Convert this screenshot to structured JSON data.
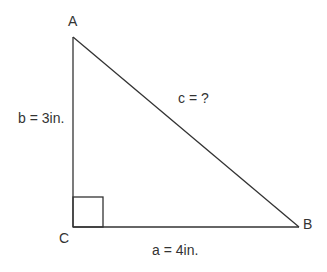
{
  "diagram": {
    "type": "right-triangle",
    "vertices": [
      {
        "id": "A",
        "label": "A",
        "x": 73,
        "y": 37
      },
      {
        "id": "B",
        "label": "B",
        "x": 299,
        "y": 227
      },
      {
        "id": "C",
        "label": "C",
        "x": 73,
        "y": 227
      }
    ],
    "sides": {
      "a": {
        "label": "a = 4in.",
        "from": "C",
        "to": "B"
      },
      "b": {
        "label": "b = 3in.",
        "from": "C",
        "to": "A"
      },
      "c": {
        "label": "c = ?",
        "from": "A",
        "to": "B"
      }
    },
    "right_angle_at": "C",
    "line_color": "#333333",
    "text_color": "#333333"
  }
}
